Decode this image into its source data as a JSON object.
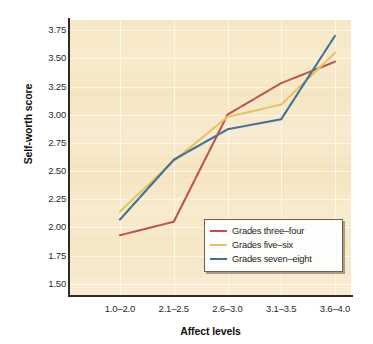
{
  "chart_data": {
    "type": "line",
    "title": "",
    "xlabel": "Affect levels",
    "ylabel": "Self-worth score",
    "categories": [
      "1.0–2.0",
      "2.1–2.5",
      "2.6–3.0",
      "3.1–3.5",
      "3.6–4.0"
    ],
    "ylim": [
      1.4,
      3.84
    ],
    "yticks": [
      "3.75",
      "3.50",
      "3.25",
      "3.00",
      "2.75",
      "2.50",
      "2.25",
      "2.00",
      "1.75",
      "1.50"
    ],
    "ytick_values": [
      3.75,
      3.5,
      3.25,
      3.0,
      2.75,
      2.5,
      2.25,
      2.0,
      1.75,
      1.5
    ],
    "grid": true,
    "legend_position": "lower right",
    "series": [
      {
        "name": "Grades three–four",
        "color": "#c0504d",
        "values": [
          1.93,
          2.05,
          3.0,
          3.28,
          3.47
        ]
      },
      {
        "name": "Grades five–six",
        "color": "#e8c25c",
        "values": [
          2.14,
          2.59,
          2.98,
          3.09,
          3.55
        ]
      },
      {
        "name": "Grades seven–eight",
        "color": "#3d7195",
        "values": [
          2.07,
          2.6,
          2.87,
          2.96,
          3.7
        ]
      }
    ]
  },
  "legend": {
    "items": [
      {
        "label": "Grades three–four",
        "color": "#c0504d"
      },
      {
        "label": "Grades five–six",
        "color": "#e8c25c"
      },
      {
        "label": "Grades seven–eight",
        "color": "#3d7195"
      }
    ]
  },
  "colors": {
    "panel_background": "#f6e7c4",
    "axis": "#2f2a22",
    "gridline": "#ffffff",
    "page_background": "#ffffff",
    "text": "#1a1a1a"
  }
}
